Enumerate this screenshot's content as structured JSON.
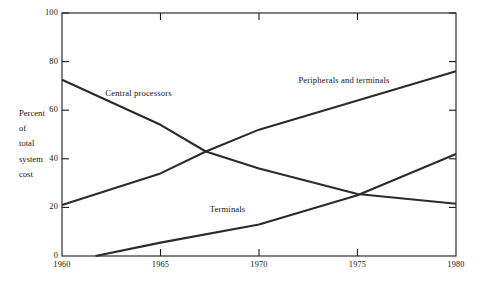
{
  "chart_data": {
    "type": "line",
    "title": "",
    "subtitle": "",
    "xlabel": "",
    "ylabel": "Percent of total system cost",
    "ylabel_lines": [
      "Percent",
      "of",
      "total",
      "system",
      "cost"
    ],
    "xlim": [
      1960,
      1980
    ],
    "ylim": [
      0,
      100
    ],
    "grid": false,
    "legend_position": "inline-annotations",
    "xticks": [
      1960,
      1965,
      1970,
      1975,
      1980
    ],
    "xtick_labels": [
      "1960",
      "1965",
      "1970",
      "1975",
      "1980"
    ],
    "yticks": [
      0,
      20,
      40,
      60,
      80,
      100
    ],
    "ytick_labels": [
      "0",
      "20",
      "40",
      "60",
      "80",
      "100"
    ],
    "series": [
      {
        "name": "Central processors",
        "label": "Central processors",
        "x": [
          1960,
          1965,
          1967.3,
          1970,
          1975,
          1980
        ],
        "values": [
          72.5,
          54.0,
          43.0,
          36.0,
          25.5,
          21.5
        ]
      },
      {
        "name": "Peripherals and terminals",
        "label": "Peripherals and terminals",
        "x": [
          1960,
          1965,
          1967.3,
          1970,
          1975,
          1980
        ],
        "values": [
          21.0,
          34.0,
          43.0,
          52.0,
          64.0,
          76.0
        ]
      },
      {
        "name": "Terminals",
        "label": "Terminals",
        "x": [
          1961.7,
          1965,
          1970,
          1975,
          1980
        ],
        "values": [
          0.0,
          5.5,
          13.0,
          25.0,
          42.0
        ]
      }
    ],
    "annotations": [
      {
        "text": "Central processors",
        "x": 1962.2,
        "y": 66.5
      },
      {
        "text": "Peripherals and terminals",
        "x": 1972.0,
        "y": 72.0
      },
      {
        "text": "Terminals",
        "x": 1967.5,
        "y": 19.0
      }
    ],
    "colors": {
      "line": "#2b2b2b",
      "axis": "#1a1a1a",
      "text": "#141414",
      "background": "#ffffff"
    }
  }
}
